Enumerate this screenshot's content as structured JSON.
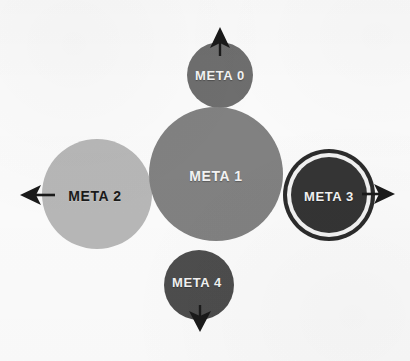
{
  "diagram": {
    "background_color": "#fbfbfb",
    "arrow_color": "#1a1a1a",
    "nodes": [
      {
        "id": "meta-0",
        "label": "META 0",
        "cx": 220,
        "cy": 75,
        "r": 33,
        "fill": "#6e6e6e",
        "text_color": "#f3f3f3",
        "text_style": "light",
        "font_size": 13,
        "ring": false
      },
      {
        "id": "meta-1",
        "label": "META 1",
        "cx": 216,
        "cy": 174,
        "r": 67,
        "fill": "#818181",
        "text_color": "#f3f3f3",
        "text_style": "light",
        "font_size": 14,
        "ring": false
      },
      {
        "id": "meta-2",
        "label": "META 2",
        "cx": 97,
        "cy": 194,
        "r": 55,
        "fill": "#b7b7b7",
        "text_color": "#1a1a1a",
        "text_style": "dark",
        "font_size": 14,
        "ring": false
      },
      {
        "id": "meta-3",
        "label": "META 3",
        "cx": 329,
        "cy": 195,
        "r": 38,
        "fill": "#343434",
        "text_color": "#f3f3f3",
        "text_style": "light",
        "font_size": 13,
        "ring": true,
        "ring_gap_color": "#f2f2f2",
        "ring_outer_color": "#2b2b2b",
        "ring_outer_r": 46,
        "ring_gap_r": 42
      },
      {
        "id": "meta-4",
        "label": "META 4",
        "cx": 199,
        "cy": 285,
        "r": 35,
        "fill": "#4d4d4d",
        "text_color": "#f3f3f3",
        "text_style": "light",
        "font_size": 13,
        "ring": false
      }
    ],
    "arrows": [
      {
        "id": "arrow-up",
        "direction": "up",
        "from_x": 220,
        "from_y": 112,
        "to_x": 220,
        "to_y": 28
      },
      {
        "id": "arrow-left",
        "direction": "left",
        "from_x": 100,
        "from_y": 195,
        "to_x": 21,
        "to_y": 195
      },
      {
        "id": "arrow-right",
        "direction": "right",
        "from_x": 318,
        "from_y": 194,
        "to_x": 394,
        "to_y": 194
      },
      {
        "id": "arrow-down",
        "direction": "down",
        "from_x": 200,
        "from_y": 250,
        "to_x": 200,
        "to_y": 331
      }
    ]
  }
}
